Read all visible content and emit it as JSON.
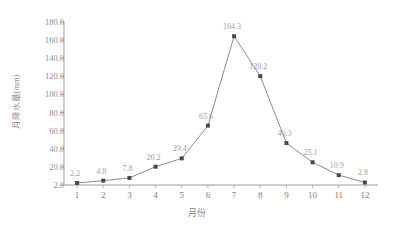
{
  "chart_data": {
    "type": "line",
    "title": "",
    "xlabel": "月份",
    "ylabel": "月降水量(mm)",
    "categories": [
      "1",
      "2",
      "3",
      "4",
      "5",
      "6",
      "7",
      "8",
      "9",
      "10",
      "11",
      "12"
    ],
    "values": [
      2.2,
      4.8,
      7.8,
      20.2,
      29.4,
      65.6,
      164.3,
      120.2,
      46.3,
      25.1,
      10.9,
      2.8
    ],
    "point_labels": [
      "2.2",
      "4.8",
      "7.8",
      "20.2",
      "29.4",
      "65.6",
      "164.3",
      "120.2",
      "46.3",
      "25.1",
      "10.9",
      "2.8"
    ],
    "ylim": [
      0,
      180
    ],
    "yticks": [
      0,
      20,
      40,
      60,
      80,
      100,
      120,
      140,
      160,
      180
    ],
    "ytick_labels": [
      "2.0",
      "20.0",
      "40.0",
      "60.0",
      "80.0",
      "100.0",
      "120.0",
      "140.0",
      "160.0",
      "180.0"
    ],
    "grid": false,
    "legend": null,
    "marker": "square",
    "line_color": "#8c8c8c",
    "marker_color": "#4a4a4a",
    "label_color": "#a0a0a0",
    "axis_color": "#9a9a9a",
    "background": "#ffffff"
  }
}
